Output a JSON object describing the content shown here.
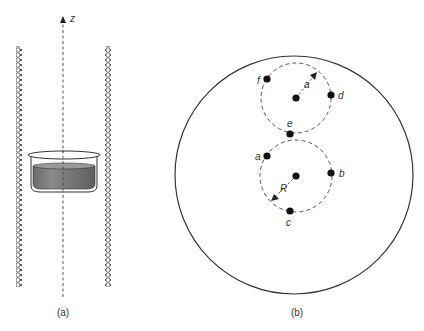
{
  "panels": {
    "a": {
      "caption": "(a)",
      "axis_label": "z",
      "coil_columns": 2,
      "coil_turns_per_column": 48,
      "container": "cylindrical dish containing liquid, centered on z axis inside solenoid"
    },
    "b": {
      "caption": "(b)",
      "outer_circle": "large container boundary (top view)",
      "upper_orbit": {
        "radius_label": "a",
        "points": [
          "f",
          "d",
          "e"
        ]
      },
      "lower_orbit": {
        "radius_label": "R",
        "points": [
          "a",
          "b",
          "c"
        ]
      }
    }
  },
  "colors": {
    "line": "#333333",
    "liquid": "#777777",
    "background": "#ffffff"
  }
}
